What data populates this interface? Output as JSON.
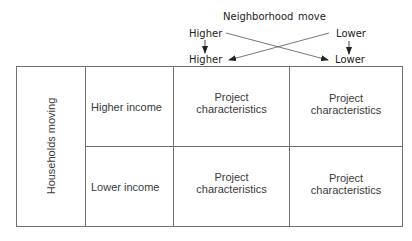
{
  "header": {
    "title_word1": "Neighborhood",
    "title_word2": "move",
    "from_higher": "Higher",
    "from_lower": "Lower",
    "to_higher": "Higher",
    "to_lower": "Lower"
  },
  "table": {
    "row_group_label": "Households moving",
    "rows": [
      {
        "label": "Higher income",
        "cells": [
          "Project characteristics",
          "Project characteristics"
        ]
      },
      {
        "label": "Lower income",
        "cells": [
          "Project characteristics",
          "Project characteristics"
        ]
      }
    ],
    "cell_line1": "Project",
    "cell_line2": "characteristics"
  },
  "colors": {
    "line": "#707070",
    "arrow": "#333333",
    "text": "#3a3a3a"
  }
}
